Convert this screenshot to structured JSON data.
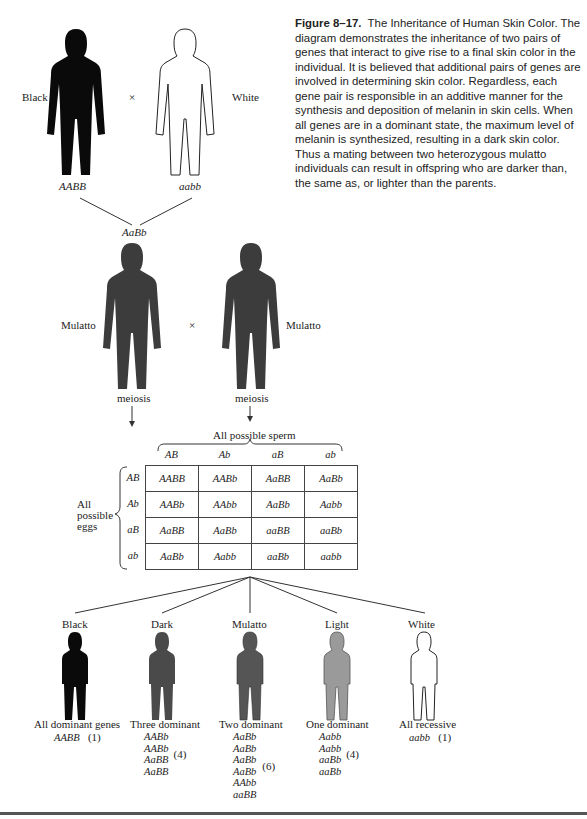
{
  "caption": {
    "figure_label": "Figure 8–17.",
    "text": "The Inheritance of Human Skin Color. The diagram demonstrates the inheritance of two pairs of genes that interact to give rise to a final skin color in the individual. It is believed that additional pairs of genes are involved in determining skin color. Regardless, each gene pair is responsible in an additive manner for the synthesis and deposition of melanin in skin cells. When all genes are in a dominant state, the maximum level of melanin is synthesized, resulting in a dark skin color. Thus a mating between two heterozygous mulatto individuals can result in offspring who are darker than, the same as, or lighter than the parents."
  },
  "parents": {
    "left": {
      "label": "Black",
      "genotype": "AABB",
      "color": "#0a0a0a"
    },
    "cross": "×",
    "right": {
      "label": "White",
      "genotype": "aabb",
      "color": "#ffffff"
    }
  },
  "f1": {
    "genotype": "AaBb",
    "left": {
      "label": "Mulatto",
      "process": "meiosis",
      "color": "#3c3c3c"
    },
    "cross": "×",
    "right": {
      "label": "Mulatto",
      "process": "meiosis",
      "color": "#3c3c3c"
    }
  },
  "punnett": {
    "sperm_label": "All possible sperm",
    "eggs_label": [
      "All",
      "possible",
      "eggs"
    ],
    "columns": [
      "AB",
      "Ab",
      "aB",
      "ab"
    ],
    "rows": [
      "AB",
      "Ab",
      "aB",
      "ab"
    ],
    "cells": [
      [
        "AABB",
        "AABb",
        "AaBB",
        "AaBb"
      ],
      [
        "AABb",
        "AAbb",
        "AaBb",
        "Aabb"
      ],
      [
        "AaBB",
        "AaBb",
        "aaBB",
        "aaBb"
      ],
      [
        "AaBb",
        "Aabb",
        "aaBb",
        "aabb"
      ]
    ]
  },
  "offspring": [
    {
      "label": "Black",
      "desc": "All dominant genes",
      "genotypes": [
        "AABB"
      ],
      "count": "(1)",
      "color": "#0a0a0a"
    },
    {
      "label": "Dark",
      "desc": "Three dominant",
      "genotypes": [
        "AABb",
        "AABb",
        "AaBB",
        "AaBB"
      ],
      "count": "(4)",
      "color": "#4a4a4a"
    },
    {
      "label": "Mulatto",
      "desc": "Two dominant",
      "genotypes": [
        "AaBb",
        "AaBb",
        "AaBb",
        "AaBb",
        "AAbb",
        "aaBB"
      ],
      "count": "(6)",
      "color": "#5a5a5a"
    },
    {
      "label": "Light",
      "desc": "One dominant",
      "genotypes": [
        "Aabb",
        "Aabb",
        "aaBb",
        "aaBb"
      ],
      "count": "(4)",
      "color": "#9a9a9a"
    },
    {
      "label": "White",
      "desc": "All recessive",
      "genotypes": [
        "aabb"
      ],
      "count": "(1)",
      "color": "#ffffff"
    }
  ]
}
